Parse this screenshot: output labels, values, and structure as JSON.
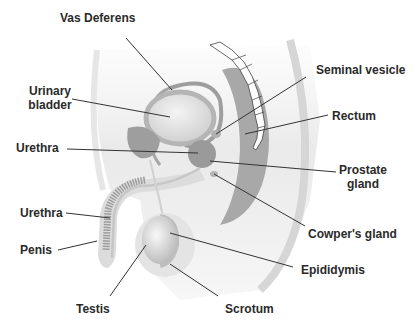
{
  "diagram": {
    "labels": {
      "vas_deferens": "Vas Deferens",
      "urinary_bladder_1": "Urinary",
      "urinary_bladder_2": "bladder",
      "urethra_upper": "Urethra",
      "seminal_vesicle": "Seminal vesicle",
      "rectum": "Rectum",
      "prostate_1": "Prostate",
      "prostate_2": "gland",
      "urethra_lower": "Urethra",
      "penis": "Penis",
      "cowpers_gland": "Cowper's gland",
      "epididymis": "Epididymis",
      "testis": "Testis",
      "scrotum": "Scrotum"
    },
    "colors": {
      "background": "#ffffff",
      "body_light": "#ececec",
      "organ_mid": "#c4c4c4",
      "organ_dark": "#9a9a9a",
      "leader_line": "#333333",
      "text": "#2a2a2a"
    }
  }
}
